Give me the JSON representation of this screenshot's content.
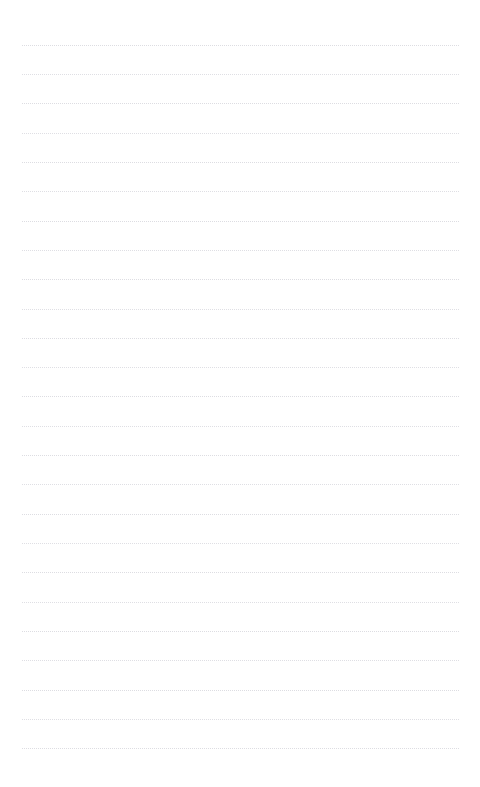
{
  "page": {
    "name": "lined-paper-sheet",
    "width": 480,
    "height": 787,
    "background_color": "#ffffff",
    "orientation": "portrait",
    "visible_text": "",
    "header_text": "",
    "footer_text": ""
  },
  "ruling": {
    "style": "dotted",
    "line_color": "#d8d8de",
    "line_thickness_px": 1,
    "line_count": 25,
    "line_spacing_px": 29.3,
    "first_line_y": 45,
    "last_line_y": 748,
    "line_start_x": 22,
    "line_end_x": 459,
    "line_width_px": 437
  },
  "margins": {
    "top_px": 45,
    "bottom_px": 37,
    "left_px": 22,
    "right_px": 21
  },
  "lines": [
    {
      "index": 1,
      "y": 45,
      "content": ""
    },
    {
      "index": 2,
      "y": 74,
      "content": ""
    },
    {
      "index": 3,
      "y": 103,
      "content": ""
    },
    {
      "index": 4,
      "y": 133,
      "content": ""
    },
    {
      "index": 5,
      "y": 162,
      "content": ""
    },
    {
      "index": 6,
      "y": 191,
      "content": ""
    },
    {
      "index": 7,
      "y": 221,
      "content": ""
    },
    {
      "index": 8,
      "y": 250,
      "content": ""
    },
    {
      "index": 9,
      "y": 279,
      "content": ""
    },
    {
      "index": 10,
      "y": 309,
      "content": ""
    },
    {
      "index": 11,
      "y": 338,
      "content": ""
    },
    {
      "index": 12,
      "y": 367,
      "content": ""
    },
    {
      "index": 13,
      "y": 396,
      "content": ""
    },
    {
      "index": 14,
      "y": 426,
      "content": ""
    },
    {
      "index": 15,
      "y": 455,
      "content": ""
    },
    {
      "index": 16,
      "y": 484,
      "content": ""
    },
    {
      "index": 17,
      "y": 514,
      "content": ""
    },
    {
      "index": 18,
      "y": 543,
      "content": ""
    },
    {
      "index": 19,
      "y": 572,
      "content": ""
    },
    {
      "index": 20,
      "y": 602,
      "content": ""
    },
    {
      "index": 21,
      "y": 631,
      "content": ""
    },
    {
      "index": 22,
      "y": 660,
      "content": ""
    },
    {
      "index": 23,
      "y": 690,
      "content": ""
    },
    {
      "index": 24,
      "y": 719,
      "content": ""
    },
    {
      "index": 25,
      "y": 748,
      "content": ""
    }
  ]
}
